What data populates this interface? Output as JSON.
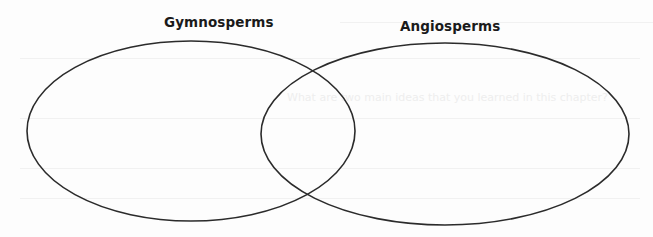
{
  "diagram": {
    "type": "venn",
    "sets": [
      {
        "label": "Gymnosperms",
        "ellipse": {
          "cx": 191,
          "cy": 131,
          "rx": 164,
          "ry": 90
        }
      },
      {
        "label": "Angiosperms",
        "ellipse": {
          "cx": 445,
          "cy": 134,
          "rx": 184,
          "ry": 91
        }
      }
    ],
    "stroke_color": "#2b2b2b",
    "background_color": "#ffffff",
    "bleed_through_text": "What are two main ideas that you learned in this chapter?"
  }
}
